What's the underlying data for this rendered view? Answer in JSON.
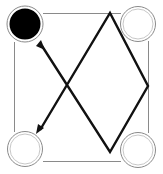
{
  "board": {
    "title": "",
    "border_color": "#8a8a8a",
    "path_color": "#111111",
    "nodes": [
      {
        "id": "top-left",
        "cx": 25,
        "cy": 24,
        "r_outer": 18,
        "r_inner": 15,
        "filled": true,
        "fill": "#000000"
      },
      {
        "id": "top-right",
        "cx": 138,
        "cy": 24,
        "r_outer": 17,
        "r_inner": 15,
        "filled": false,
        "fill": "#ffffff"
      },
      {
        "id": "bottom-left",
        "cx": 25,
        "cy": 149,
        "r_outer": 17,
        "r_inner": 15,
        "filled": false,
        "fill": "#ffffff"
      },
      {
        "id": "bottom-right",
        "cx": 138,
        "cy": 150,
        "r_outer": 17,
        "r_inner": 15,
        "filled": false,
        "fill": "#ffffff"
      }
    ],
    "path_points": [
      [
        42,
        46
      ],
      [
        110,
        152
      ],
      [
        148,
        86
      ],
      [
        110,
        13
      ],
      [
        40,
        130
      ]
    ],
    "arrows": [
      {
        "id": "arrow-start",
        "tip": [
          44,
          48
        ],
        "from": [
          36,
          38
        ]
      },
      {
        "id": "arrow-end",
        "tip": [
          38,
          132
        ],
        "from": [
          46,
          121
        ]
      }
    ]
  }
}
